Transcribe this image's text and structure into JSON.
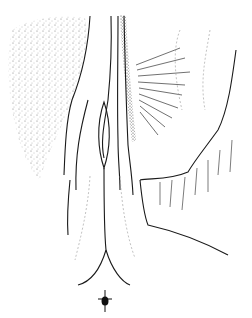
{
  "figure": {
    "type": "line-drawing",
    "background": "#ffffff",
    "ink": "#1a1a1a",
    "stipple": "#555555",
    "labels": []
  }
}
